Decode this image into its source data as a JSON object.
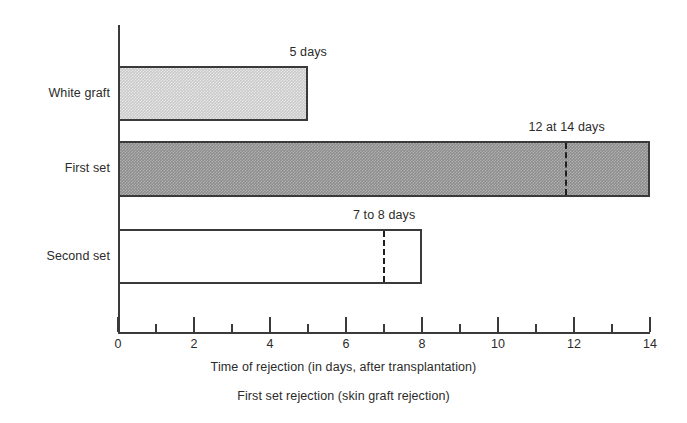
{
  "chart_data": {
    "type": "bar",
    "orientation": "horizontal",
    "title": "",
    "caption": "First set rejection (skin graft rejection)",
    "xlabel": "Time of rejection (in days, after transplantation)",
    "ylabel": "",
    "xlim": [
      0,
      14
    ],
    "grid": false,
    "legend": null,
    "x_ticks_major": [
      0,
      2,
      4,
      6,
      8,
      10,
      12,
      14
    ],
    "x_ticks_minor": [
      1,
      3,
      5,
      7,
      9,
      11,
      13
    ],
    "x_tick_labels": [
      "0",
      "2",
      "4",
      "6",
      "8",
      "10",
      "12",
      "14"
    ],
    "categories": [
      "White graft",
      "First set",
      "Second set"
    ],
    "values": [
      5,
      14,
      8
    ],
    "series": [
      {
        "name": "Time of rejection",
        "values": [
          5,
          14,
          8
        ]
      }
    ],
    "bars": [
      {
        "category": "White graft",
        "value": 5,
        "start": 0,
        "end": 5,
        "fill": "light-gray-hatch",
        "fill_color": "#c9c9c9",
        "annotation": "5 days",
        "annotation_value": 5,
        "marker": null
      },
      {
        "category": "First set",
        "value": 14,
        "start": 0,
        "end": 14,
        "fill": "dark-gray-hatch",
        "fill_color": "#8d8d8d",
        "annotation": "12 at 14 days",
        "annotation_value": 14,
        "marker": 11.8
      },
      {
        "category": "Second set",
        "value": 8,
        "start": 0,
        "end": 8,
        "fill": "white-open",
        "fill_color": "#ffffff",
        "annotation": "7 to 8 days",
        "annotation_value": 8,
        "marker": 7
      }
    ],
    "annotations": [
      "5 days",
      "12 at 14 days",
      "7 to 8 days"
    ],
    "colors": {
      "axis": "#3a3a3a",
      "text": "#2b2b2b",
      "bar_light": "#c9c9c9",
      "bar_dark": "#8d8d8d",
      "bar_open": "#ffffff",
      "marker": "#1f1f1f",
      "background": "#ffffff"
    }
  }
}
